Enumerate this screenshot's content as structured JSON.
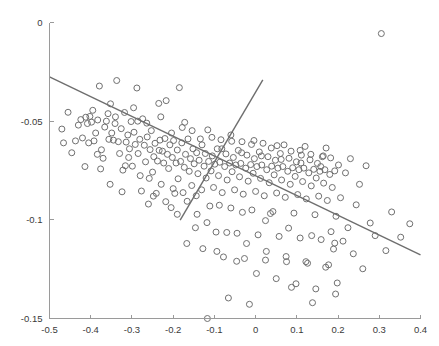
{
  "chart_data": {
    "type": "scatter",
    "title": "",
    "subtitle": "",
    "xlabel": "",
    "ylabel": "",
    "xlim": [
      -0.5,
      0.4
    ],
    "ylim": [
      -0.15,
      0.0
    ],
    "grid": false,
    "legend": null,
    "xticks": [
      -0.5,
      -0.4,
      -0.3,
      -0.2,
      -0.1,
      0,
      0.1,
      0.2,
      0.3,
      0.4
    ],
    "xticklabels": [
      "-0.5",
      "-0.4",
      "-0.3",
      "-0.2",
      "-0.1",
      "0",
      "0.1",
      "0.2",
      "0.3",
      "0.4"
    ],
    "yticks": [
      0,
      -0.05,
      -0.1,
      -0.15
    ],
    "yticklabels": [
      "0",
      "-0.05",
      "-0.1",
      "-0.15"
    ],
    "marker": {
      "shape": "circle-open",
      "size": 6,
      "stroke_color": "#707070",
      "fill": "none"
    },
    "series": [
      {
        "name": "points",
        "type": "scatter",
        "points": [
          [
            -0.455,
            -0.0455
          ],
          [
            -0.437,
            -0.06
          ],
          [
            -0.43,
            -0.052
          ],
          [
            -0.424,
            -0.0492
          ],
          [
            -0.414,
            -0.073
          ],
          [
            -0.408,
            -0.0512
          ],
          [
            -0.402,
            -0.0476
          ],
          [
            -0.398,
            -0.0505
          ],
          [
            -0.392,
            -0.06
          ],
          [
            -0.388,
            -0.056
          ],
          [
            -0.383,
            -0.0494
          ],
          [
            -0.379,
            -0.0322
          ],
          [
            -0.374,
            -0.0645
          ],
          [
            -0.37,
            -0.0688
          ],
          [
            -0.366,
            -0.053
          ],
          [
            -0.362,
            -0.05
          ],
          [
            -0.358,
            -0.0462
          ],
          [
            -0.353,
            -0.082
          ],
          [
            -0.349,
            -0.056
          ],
          [
            -0.345,
            -0.0596
          ],
          [
            -0.341,
            -0.0512
          ],
          [
            -0.337,
            -0.0294
          ],
          [
            -0.333,
            -0.0604
          ],
          [
            -0.33,
            -0.0664
          ],
          [
            -0.326,
            -0.0538
          ],
          [
            -0.322,
            -0.0748
          ],
          [
            -0.318,
            -0.0456
          ],
          [
            -0.314,
            -0.0606
          ],
          [
            -0.31,
            -0.057
          ],
          [
            -0.306,
            -0.064
          ],
          [
            -0.302,
            -0.0502
          ],
          [
            -0.299,
            -0.0728
          ],
          [
            -0.295,
            -0.0556
          ],
          [
            -0.292,
            -0.0618
          ],
          [
            -0.288,
            -0.0332
          ],
          [
            -0.285,
            -0.0664
          ],
          [
            -0.281,
            -0.0592
          ],
          [
            -0.277,
            -0.0854
          ],
          [
            -0.274,
            -0.0488
          ],
          [
            -0.27,
            -0.0622
          ],
          [
            -0.267,
            -0.0706
          ],
          [
            -0.263,
            -0.058
          ],
          [
            -0.26,
            -0.092
          ],
          [
            -0.256,
            -0.0644
          ],
          [
            -0.253,
            -0.0548
          ],
          [
            -0.25,
            -0.0758
          ],
          [
            -0.247,
            -0.068
          ],
          [
            -0.244,
            -0.0612
          ],
          [
            -0.241,
            -0.0866
          ],
          [
            -0.238,
            -0.0702
          ],
          [
            -0.235,
            -0.041
          ],
          [
            -0.232,
            -0.0596
          ],
          [
            -0.229,
            -0.082
          ],
          [
            -0.226,
            -0.0652
          ],
          [
            -0.223,
            -0.0712
          ],
          [
            -0.22,
            -0.0588
          ],
          [
            -0.217,
            -0.0396
          ],
          [
            -0.214,
            -0.0668
          ],
          [
            -0.211,
            -0.074
          ],
          [
            -0.208,
            -0.062
          ],
          [
            -0.205,
            -0.0938
          ],
          [
            -0.202,
            -0.0684
          ],
          [
            -0.199,
            -0.0598
          ],
          [
            -0.196,
            -0.0866
          ],
          [
            -0.193,
            -0.0712
          ],
          [
            -0.19,
            -0.0646
          ],
          [
            -0.188,
            -0.0792
          ],
          [
            -0.185,
            -0.033
          ],
          [
            -0.182,
            -0.0704
          ],
          [
            -0.179,
            -0.061
          ],
          [
            -0.176,
            -0.0862
          ],
          [
            -0.173,
            -0.0734
          ],
          [
            -0.17,
            -0.0668
          ],
          [
            -0.167,
            -0.112
          ],
          [
            -0.164,
            -0.059
          ],
          [
            -0.161,
            -0.0754
          ],
          [
            -0.158,
            -0.069
          ],
          [
            -0.155,
            -0.0826
          ],
          [
            -0.152,
            -0.064
          ],
          [
            -0.149,
            -0.0716
          ],
          [
            -0.146,
            -0.104
          ],
          [
            -0.143,
            -0.066
          ],
          [
            -0.14,
            -0.0766
          ],
          [
            -0.137,
            -0.0698
          ],
          [
            -0.134,
            -0.059
          ],
          [
            -0.131,
            -0.0848
          ],
          [
            -0.128,
            -0.1146
          ],
          [
            -0.125,
            -0.0728
          ],
          [
            -0.122,
            -0.0664
          ],
          [
            -0.12,
            -0.0788
          ],
          [
            -0.117,
            -0.15
          ],
          [
            -0.114,
            -0.0704
          ],
          [
            -0.111,
            -0.093
          ],
          [
            -0.108,
            -0.0752
          ],
          [
            -0.105,
            -0.0676
          ],
          [
            -0.102,
            -0.0836
          ],
          [
            -0.099,
            -0.0718
          ],
          [
            -0.096,
            -0.1062
          ],
          [
            -0.093,
            -0.064
          ],
          [
            -0.09,
            -0.0776
          ],
          [
            -0.087,
            -0.0708
          ],
          [
            -0.084,
            -0.0594
          ],
          [
            -0.081,
            -0.0862
          ],
          [
            -0.078,
            -0.1188
          ],
          [
            -0.075,
            -0.073
          ],
          [
            -0.072,
            -0.0666
          ],
          [
            -0.069,
            -0.0798
          ],
          [
            -0.066,
            -0.1396
          ],
          [
            -0.063,
            -0.0712
          ],
          [
            -0.06,
            -0.094
          ],
          [
            -0.057,
            -0.0756
          ],
          [
            -0.054,
            -0.0684
          ],
          [
            -0.051,
            -0.0848
          ],
          [
            -0.048,
            -0.0722
          ],
          [
            -0.045,
            -0.1068
          ],
          [
            -0.042,
            -0.0648
          ],
          [
            -0.039,
            -0.0782
          ],
          [
            -0.036,
            -0.0714
          ],
          [
            -0.033,
            -0.0604
          ],
          [
            -0.03,
            -0.087
          ],
          [
            -0.027,
            -0.1196
          ],
          [
            -0.024,
            -0.0738
          ],
          [
            -0.021,
            -0.0672
          ],
          [
            -0.018,
            -0.0804
          ],
          [
            -0.015,
            -0.1428
          ],
          [
            -0.012,
            -0.072
          ],
          [
            -0.009,
            -0.095
          ],
          [
            -0.006,
            -0.0764
          ],
          [
            -0.003,
            -0.069
          ],
          [
            0.0,
            -0.0856
          ],
          [
            0.003,
            -0.073
          ],
          [
            0.006,
            -0.1076
          ],
          [
            0.009,
            -0.0656
          ],
          [
            0.012,
            -0.079
          ],
          [
            0.015,
            -0.0722
          ],
          [
            0.018,
            -0.0612
          ],
          [
            0.021,
            -0.0878
          ],
          [
            0.024,
            -0.1204
          ],
          [
            0.027,
            -0.0746
          ],
          [
            0.03,
            -0.068
          ],
          [
            0.033,
            -0.0812
          ],
          [
            0.036,
            -0.0968
          ],
          [
            0.039,
            -0.0728
          ],
          [
            0.042,
            -0.0958
          ],
          [
            0.045,
            -0.0772
          ],
          [
            0.048,
            -0.0698
          ],
          [
            0.051,
            -0.0864
          ],
          [
            0.054,
            -0.0738
          ],
          [
            0.057,
            -0.1084
          ],
          [
            0.06,
            -0.0664
          ],
          [
            0.063,
            -0.0798
          ],
          [
            0.066,
            -0.073
          ],
          [
            0.069,
            -0.062
          ],
          [
            0.072,
            -0.0886
          ],
          [
            0.075,
            -0.1212
          ],
          [
            0.078,
            -0.0754
          ],
          [
            0.081,
            -0.0688
          ],
          [
            0.084,
            -0.082
          ],
          [
            0.087,
            -0.1342
          ],
          [
            0.09,
            -0.0736
          ],
          [
            0.093,
            -0.0966
          ],
          [
            0.096,
            -0.078
          ],
          [
            0.099,
            -0.0706
          ],
          [
            0.102,
            -0.0872
          ],
          [
            0.105,
            -0.0746
          ],
          [
            0.108,
            -0.1092
          ],
          [
            0.111,
            -0.0672
          ],
          [
            0.114,
            -0.0806
          ],
          [
            0.117,
            -0.0738
          ],
          [
            0.12,
            -0.0628
          ],
          [
            0.123,
            -0.0894
          ],
          [
            0.126,
            -0.122
          ],
          [
            0.129,
            -0.0762
          ],
          [
            0.132,
            -0.0696
          ],
          [
            0.135,
            -0.0828
          ],
          [
            0.138,
            -0.142
          ],
          [
            0.141,
            -0.0744
          ],
          [
            0.144,
            -0.0974
          ],
          [
            0.147,
            -0.0788
          ],
          [
            0.15,
            -0.0714
          ],
          [
            0.153,
            -0.088
          ],
          [
            0.156,
            -0.0754
          ],
          [
            0.159,
            -0.11
          ],
          [
            0.162,
            -0.068
          ],
          [
            0.165,
            -0.0814
          ],
          [
            0.168,
            -0.0746
          ],
          [
            0.171,
            -0.0636
          ],
          [
            0.174,
            -0.0902
          ],
          [
            0.177,
            -0.1228
          ],
          [
            0.18,
            -0.077
          ],
          [
            0.183,
            -0.106
          ],
          [
            0.186,
            -0.0836
          ],
          [
            0.189,
            -0.1148
          ],
          [
            0.192,
            -0.0752
          ],
          [
            0.195,
            -0.0982
          ],
          [
            0.198,
            -0.132
          ],
          [
            0.201,
            -0.0722
          ],
          [
            0.206,
            -0.0888
          ],
          [
            0.212,
            -0.1108
          ],
          [
            0.218,
            -0.0762
          ],
          [
            0.224,
            -0.104
          ],
          [
            0.23,
            -0.069
          ],
          [
            0.237,
            -0.1172
          ],
          [
            0.244,
            -0.0924
          ],
          [
            0.252,
            -0.082
          ],
          [
            0.26,
            -0.1248
          ],
          [
            0.268,
            -0.0726
          ],
          [
            0.278,
            -0.1016
          ],
          [
            0.29,
            -0.108
          ],
          [
            0.305,
            -0.0056
          ],
          [
            0.316,
            -0.1156
          ],
          [
            0.33,
            -0.096
          ],
          [
            0.352,
            -0.1088
          ],
          [
            0.374,
            -0.102
          ],
          [
            -0.47,
            -0.054
          ],
          [
            -0.446,
            -0.066
          ],
          [
            -0.42,
            -0.0585
          ],
          [
            -0.405,
            -0.061
          ],
          [
            -0.395,
            -0.0445
          ],
          [
            -0.376,
            -0.0742
          ],
          [
            -0.356,
            -0.0592
          ],
          [
            -0.34,
            -0.0478
          ],
          [
            -0.324,
            -0.0858
          ],
          [
            -0.308,
            -0.0684
          ],
          [
            -0.296,
            -0.0432
          ],
          [
            -0.28,
            -0.0776
          ],
          [
            -0.264,
            -0.051
          ],
          [
            -0.248,
            -0.088
          ],
          [
            -0.234,
            -0.0648
          ],
          [
            -0.218,
            -0.0908
          ],
          [
            -0.204,
            -0.056
          ],
          [
            -0.19,
            -0.0972
          ],
          [
            -0.178,
            -0.0532
          ],
          [
            -0.166,
            -0.0906
          ],
          [
            -0.154,
            -0.0548
          ],
          [
            -0.142,
            -0.0972
          ],
          [
            -0.13,
            -0.062
          ],
          [
            -0.118,
            -0.1014
          ],
          [
            -0.106,
            -0.0582
          ],
          [
            -0.094,
            -0.116
          ],
          [
            -0.082,
            -0.064
          ],
          [
            -0.07,
            -0.1064
          ],
          [
            -0.058,
            -0.0602
          ],
          [
            -0.046,
            -0.121
          ],
          [
            -0.034,
            -0.066
          ],
          [
            -0.022,
            -0.112
          ],
          [
            -0.01,
            -0.0618
          ],
          [
            0.002,
            -0.1272
          ],
          [
            0.014,
            -0.0676
          ],
          [
            0.026,
            -0.116
          ],
          [
            0.038,
            -0.0636
          ],
          [
            0.05,
            -0.1298
          ],
          [
            0.062,
            -0.0694
          ],
          [
            0.074,
            -0.1186
          ],
          [
            0.086,
            -0.0652
          ],
          [
            0.098,
            -0.1324
          ],
          [
            0.11,
            -0.0712
          ],
          [
            0.122,
            -0.1212
          ],
          [
            0.134,
            -0.0668
          ],
          [
            0.146,
            -0.135
          ],
          [
            0.158,
            -0.073
          ],
          [
            0.17,
            -0.124
          ],
          [
            0.182,
            -0.0686
          ],
          [
            0.194,
            -0.1376
          ],
          [
            -0.466,
            -0.061
          ],
          [
            -0.412,
            -0.048
          ],
          [
            -0.384,
            -0.0668
          ],
          [
            -0.352,
            -0.0412
          ],
          [
            -0.316,
            -0.0726
          ],
          [
            -0.286,
            -0.05
          ],
          [
            -0.258,
            -0.079
          ],
          [
            -0.23,
            -0.0478
          ],
          [
            -0.2,
            -0.0842
          ],
          [
            -0.172,
            -0.0506
          ],
          [
            -0.144,
            -0.0878
          ],
          [
            -0.116,
            -0.0544
          ],
          [
            -0.088,
            -0.0926
          ],
          [
            -0.06,
            -0.057
          ],
          [
            -0.032,
            -0.0962
          ],
          [
            -0.004,
            -0.0598
          ],
          [
            0.024,
            -0.1004
          ],
          [
            0.052,
            -0.0624
          ],
          [
            0.08,
            -0.1042
          ],
          [
            0.108,
            -0.0648
          ],
          [
            0.136,
            -0.108
          ],
          [
            0.164,
            -0.0676
          ],
          [
            0.192,
            -0.1118
          ]
        ]
      }
    ],
    "fit_lines": [
      {
        "name": "primary-regression-line",
        "slope": -0.0676,
        "intercept": -0.0826,
        "x_start": -0.5,
        "x_end": 0.4,
        "y_start": -0.0275,
        "y_end": -0.1177,
        "color": "#6e6e6e"
      },
      {
        "name": "secondary-regression-line",
        "slope": 0.3459,
        "intercept": -0.0189,
        "x_start": -0.183,
        "x_end": 0.0175,
        "y_start": -0.1002,
        "y_end": -0.0291,
        "color": "#6e6e6e"
      }
    ]
  },
  "axes": {
    "x_axis_label": "",
    "y_axis_label": ""
  }
}
